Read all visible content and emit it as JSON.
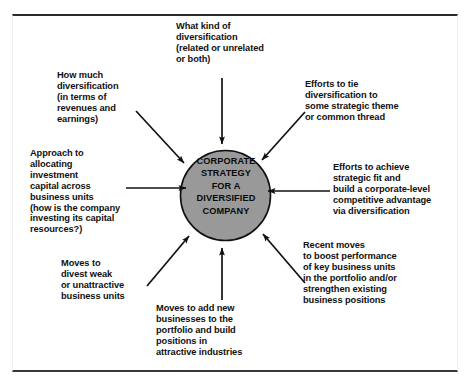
{
  "diagram": {
    "title_lines": "CORPORATE\nSTRATEGY\nFOR A\nDIVERSIFIED\nCOMPANY",
    "center_fill": "#999999",
    "center_stroke": "#111111",
    "arrow_color": "#111111",
    "frame_color": "#2b2b2b",
    "nodes": [
      {
        "id": "what-kind-of-diversification",
        "text": "What kind of\ndiversification\n(related or unrelated\nor both)",
        "x": 176,
        "y": 21
      },
      {
        "id": "how-much-diversification",
        "text": "How much\ndiversification\n(in terms of\nrevenues and\nearnings)",
        "x": 57,
        "y": 70
      },
      {
        "id": "efforts-to-tie-diversification",
        "text": "Efforts to tie\ndiversification to\nsome strategic theme\nor common thread",
        "x": 305,
        "y": 79
      },
      {
        "id": "approach-to-allocating-investment-capital",
        "text": "Approach to\nallocating\ninvestment\ncapital across\nbusiness units\n(how is the company\ninvesting its capital\nresources?)",
        "x": 30,
        "y": 148
      },
      {
        "id": "efforts-to-achieve-strategic-fit",
        "text": "Efforts to achieve\nstrategic fit and\nbuild a corporate-level\ncompetitive advantage\nvia diversification",
        "x": 333,
        "y": 162
      },
      {
        "id": "recent-moves-to-boost-performance",
        "text": "Recent moves\nto boost performance\nof key business units\nin the portfolio and/or\nstrengthen existing\nbusiness positions",
        "x": 303,
        "y": 240
      },
      {
        "id": "moves-to-divest-weak-units",
        "text": "Moves to\ndivest weak\nor unattractive\nbusiness units",
        "x": 61,
        "y": 258
      },
      {
        "id": "moves-to-add-new-businesses",
        "text": "Moves to add new\nbusinesses to the\nportfolio and build\npositions in\nattractive industries",
        "x": 156,
        "y": 303
      }
    ]
  }
}
